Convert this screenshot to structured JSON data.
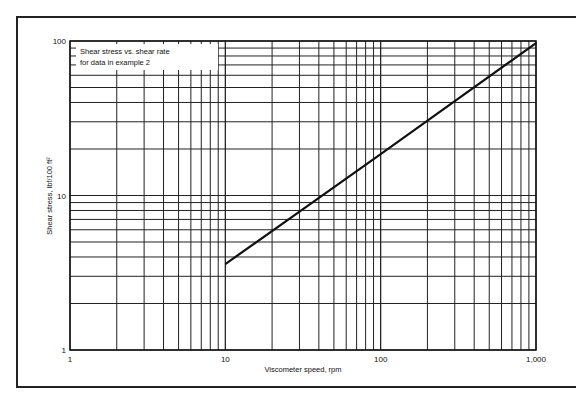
{
  "chart_data": {
    "type": "line",
    "scale": "log-log",
    "title": "",
    "annotation": [
      "Shear stress vs. shear rate",
      "for data in example 2"
    ],
    "xlabel": "Viscometer speed, rpm",
    "ylabel": "Shear stress, lbf/100 ft²",
    "xlim": [
      1,
      1000
    ],
    "ylim": [
      1,
      100
    ],
    "x_tick_labels": [
      "1",
      "10",
      "100",
      "1,000"
    ],
    "y_tick_labels": [
      "1",
      "10",
      "100"
    ],
    "grid": true,
    "series": [
      {
        "name": "Shear stress vs. shear rate",
        "x": [
          10,
          100,
          1000
        ],
        "y": [
          3.6,
          18.5,
          97
        ]
      }
    ]
  }
}
